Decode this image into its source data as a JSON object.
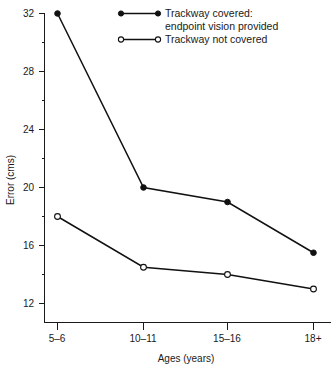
{
  "chart_data": {
    "type": "line",
    "title": "",
    "xlabel": "Ages (years)",
    "ylabel": "Error (cms)",
    "categories": [
      "5–6",
      "10–11",
      "15–16",
      "18+"
    ],
    "ylim": [
      12,
      32
    ],
    "ytick_labels": [
      "12",
      "16",
      "20",
      "24",
      "28",
      "32"
    ],
    "ytick_values": [
      12,
      16,
      20,
      24,
      28,
      32
    ],
    "yminor_values": [
      14,
      18,
      22,
      26,
      30
    ],
    "grid": false,
    "legend_position": "top-right",
    "series": [
      {
        "name": "Trackway covered:\nendpoint vision provided",
        "name_line1": "Trackway covered:",
        "name_line2": "endpoint vision provided",
        "marker": "filled-circle",
        "color": "#111111",
        "values": [
          32,
          20,
          19,
          15.5
        ]
      },
      {
        "name": "Trackway not covered",
        "name_line1": "Trackway not covered",
        "name_line2": "",
        "marker": "open-circle",
        "color": "#111111",
        "values": [
          18,
          14.5,
          14,
          13
        ]
      }
    ]
  },
  "legend": {
    "entries": [
      {
        "label_line1": "Trackway covered:",
        "label_line2": "endpoint vision provided"
      },
      {
        "label_line1": "Trackway not covered",
        "label_line2": ""
      }
    ]
  },
  "axes": {
    "y_title": "Error (cms)",
    "x_title": "Ages (years)",
    "y_labels": [
      "32",
      "28",
      "24",
      "20",
      "16",
      "12"
    ],
    "x_labels": [
      "5–6",
      "10–11",
      "15–16",
      "18+"
    ]
  }
}
